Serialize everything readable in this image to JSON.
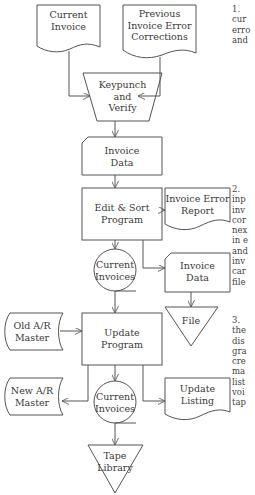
{
  "diagram": {
    "nodes": {
      "current_invoice": {
        "label": "Current\nInvoice",
        "shape": "document"
      },
      "prev_corrections": {
        "label": "Previous\nInvoice Error\nCorrections",
        "shape": "document"
      },
      "keypunch": {
        "label": "Keypunch\nand\nVerify",
        "shape": "manual-operation"
      },
      "invoice_data_1": {
        "label": "Invoice\nData",
        "shape": "punched-card"
      },
      "edit_sort": {
        "label": "Edit & Sort\nProgram",
        "shape": "process"
      },
      "error_report": {
        "label": "Invoice Error\nReport",
        "shape": "document"
      },
      "current_invoices_1": {
        "label": "Current\nInvoices",
        "shape": "magnetic-tape"
      },
      "invoice_data_2": {
        "label": "Invoice\nData",
        "shape": "punched-card"
      },
      "file": {
        "label": "File",
        "shape": "offline-storage"
      },
      "old_ar_master": {
        "label": "Old A/R\nMaster",
        "shape": "stored-data"
      },
      "update_program": {
        "label": "Update\nProgram",
        "shape": "process"
      },
      "new_ar_master": {
        "label": "New A/R\nMaster",
        "shape": "stored-data"
      },
      "current_invoices_2": {
        "label": "Current\nInvoices",
        "shape": "magnetic-tape"
      },
      "update_listing": {
        "label": "Update\nListing",
        "shape": "document"
      },
      "tape_library": {
        "label": "Tape\nLibrary",
        "shape": "offline-storage"
      }
    },
    "edges": [
      [
        "current_invoice",
        "keypunch"
      ],
      [
        "prev_corrections",
        "keypunch"
      ],
      [
        "keypunch",
        "invoice_data_1"
      ],
      [
        "invoice_data_1",
        "edit_sort"
      ],
      [
        "edit_sort",
        "error_report"
      ],
      [
        "edit_sort",
        "current_invoices_1"
      ],
      [
        "edit_sort",
        "invoice_data_2"
      ],
      [
        "invoice_data_2",
        "file"
      ],
      [
        "current_invoices_1",
        "update_program"
      ],
      [
        "old_ar_master",
        "update_program"
      ],
      [
        "update_program",
        "new_ar_master"
      ],
      [
        "update_program",
        "current_invoices_2"
      ],
      [
        "update_program",
        "update_listing"
      ],
      [
        "current_invoices_2",
        "tape_library"
      ]
    ],
    "notes": {
      "n1": "1.\ncur\nerro\nand",
      "n2": "2.\ninp\ninv\ncor\nnex\nin e\nand\ninv\ncar\nfile",
      "n3": "3.\nthe\ndis\ngra\ncre\nma\nlist\nvoi\ntap"
    }
  }
}
